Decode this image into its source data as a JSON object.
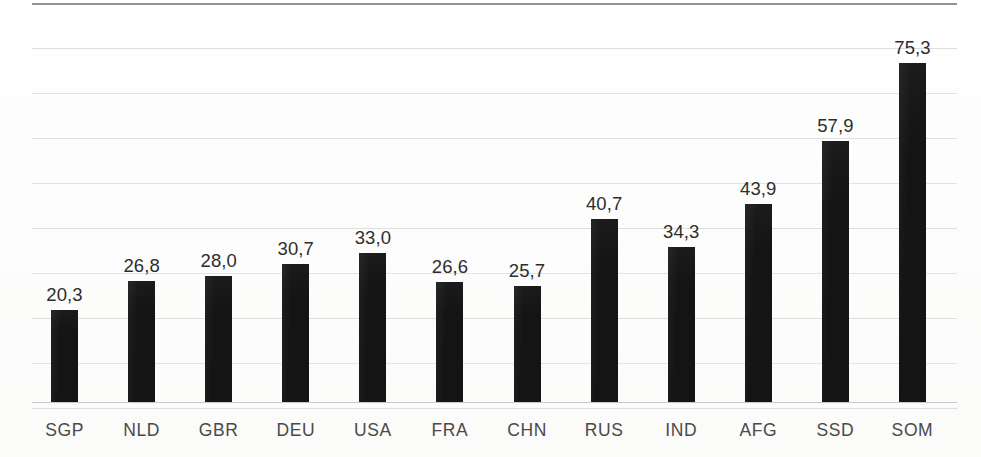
{
  "chart_data": {
    "type": "bar",
    "title": "",
    "subtitle": "",
    "xlabel": "",
    "ylabel": "",
    "categories": [
      "SGP",
      "NLD",
      "GBR",
      "DEU",
      "USA",
      "FRA",
      "CHN",
      "RUS",
      "IND",
      "AFG",
      "SSD",
      "SOM"
    ],
    "values": [
      20.3,
      26.8,
      28.0,
      30.7,
      33.0,
      26.6,
      25.7,
      40.7,
      34.3,
      43.9,
      57.9,
      75.3
    ],
    "value_labels": [
      "20,3",
      "26,8",
      "28,0",
      "30,7",
      "33,0",
      "26,6",
      "25,7",
      "40,7",
      "34,3",
      "43,9",
      "57,9",
      "75,3"
    ],
    "decimal_separator": ",",
    "ylim": [
      0,
      88.5
    ],
    "xtick_labels": [
      "SGP",
      "NLD",
      "GBR",
      "DEU",
      "USA",
      "FRA",
      "CHN",
      "RUS",
      "IND",
      "AFG",
      "SSD",
      "SOM"
    ],
    "ytick_labels": [],
    "grid": true,
    "gridlines_count": 9,
    "legend": [],
    "legend_position": "none",
    "annotations": [],
    "series": [
      {
        "name": "",
        "values": [
          20.3,
          26.8,
          28.0,
          30.7,
          33.0,
          26.6,
          25.7,
          40.7,
          34.3,
          43.9,
          57.9,
          75.3
        ]
      }
    ],
    "colors": {
      "bar": "#141414",
      "gridline": "#dcdcdc",
      "top_rule": "#8a8a8a",
      "baseline": "#c8c8c8",
      "value_label": "#2d2d2d",
      "category_label": "#4a4a4a",
      "background": "#fdfdfc"
    }
  },
  "bars": [
    {
      "category": "SGP",
      "value": 20.3,
      "label": "20,3"
    },
    {
      "category": "NLD",
      "value": 26.8,
      "label": "26,8"
    },
    {
      "category": "GBR",
      "value": 28.0,
      "label": "28,0"
    },
    {
      "category": "DEU",
      "value": 30.7,
      "label": "30,7"
    },
    {
      "category": "USA",
      "value": 33.0,
      "label": "33,0"
    },
    {
      "category": "FRA",
      "value": 26.6,
      "label": "26,6"
    },
    {
      "category": "CHN",
      "value": 25.7,
      "label": "25,7"
    },
    {
      "category": "RUS",
      "value": 40.7,
      "label": "40,7"
    },
    {
      "category": "IND",
      "value": 34.3,
      "label": "34,3"
    },
    {
      "category": "AFG",
      "value": 43.9,
      "label": "43,9"
    },
    {
      "category": "SSD",
      "value": 57.9,
      "label": "57,9"
    },
    {
      "category": "SOM",
      "value": 75.3,
      "label": "75,3"
    }
  ]
}
